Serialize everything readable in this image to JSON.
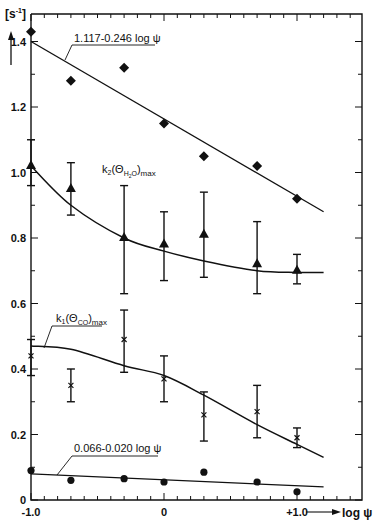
{
  "chart_data": {
    "type": "scatter",
    "title": "",
    "xlabel": "log ψ",
    "ylabel": "[s⁻¹]",
    "xlim": [
      -1.0,
      1.45
    ],
    "ylim": [
      0,
      1.48
    ],
    "x_ticks": [
      "-1.0",
      "0",
      "+1.0"
    ],
    "y_ticks": [
      "0",
      "0.2",
      "0.4",
      "0.6",
      "0.8",
      "1.0",
      "1.2",
      "1.4"
    ],
    "grid": false,
    "series": [
      {
        "name": "1.117 - 0.246 log ψ",
        "marker": "diamond",
        "x": [
          -1.0,
          -0.7,
          -0.3,
          0.0,
          0.3,
          0.7,
          1.0
        ],
        "y": [
          1.43,
          1.28,
          1.32,
          1.15,
          1.05,
          1.02,
          0.92
        ],
        "fit": {
          "type": "line",
          "x": [
            -1.0,
            1.2
          ],
          "y": [
            1.4,
            0.88
          ]
        }
      },
      {
        "name": "k2(ΘH2O)max",
        "marker": "triangle",
        "x": [
          -1.0,
          -0.7,
          -0.3,
          0.0,
          0.3,
          0.7,
          1.0
        ],
        "y": [
          1.02,
          0.95,
          0.8,
          0.78,
          0.81,
          0.72,
          0.7
        ],
        "err_low": [
          0.96,
          0.87,
          0.63,
          0.67,
          0.68,
          0.63,
          0.66
        ],
        "err_high": [
          1.1,
          1.03,
          0.96,
          0.88,
          0.94,
          0.85,
          0.75
        ],
        "fit": {
          "type": "curve",
          "x": [
            -1.0,
            -0.7,
            -0.3,
            0.0,
            0.3,
            0.7,
            1.0,
            1.2
          ],
          "y": [
            1.02,
            0.9,
            0.8,
            0.76,
            0.73,
            0.7,
            0.695,
            0.695
          ]
        }
      },
      {
        "name": "k1(ΘCO)max",
        "marker": "x",
        "x": [
          -1.0,
          -0.7,
          -0.3,
          0.0,
          0.3,
          0.7,
          1.0
        ],
        "y": [
          0.44,
          0.35,
          0.49,
          0.37,
          0.26,
          0.27,
          0.19
        ],
        "err_low": [
          0.38,
          0.3,
          0.39,
          0.3,
          0.18,
          0.19,
          0.16
        ],
        "err_high": [
          0.49,
          0.4,
          0.58,
          0.44,
          0.33,
          0.35,
          0.22
        ],
        "fit": {
          "type": "curve",
          "x": [
            -1.0,
            -0.7,
            -0.3,
            0.0,
            0.3,
            0.7,
            1.0,
            1.2
          ],
          "y": [
            0.47,
            0.46,
            0.41,
            0.38,
            0.32,
            0.23,
            0.17,
            0.13
          ]
        }
      },
      {
        "name": "0.066 - 0.020 log ψ",
        "marker": "circle",
        "x": [
          -1.0,
          -0.7,
          -0.3,
          0.0,
          0.3,
          0.7,
          1.0
        ],
        "y": [
          0.09,
          0.06,
          0.065,
          0.055,
          0.085,
          0.055,
          0.025
        ],
        "fit": {
          "type": "line",
          "x": [
            -1.0,
            1.2
          ],
          "y": [
            0.08,
            0.04
          ]
        }
      }
    ],
    "annotations": [
      "1.117-0.246 log ψ",
      "k2(ΘH2O)max",
      "k1(ΘCO)max",
      "0.066-0.020 log ψ"
    ]
  },
  "labels": {
    "y_unit": "[s",
    "y_unit_sup": "-1",
    "y_unit_close": "]",
    "x_axis_label": "log ψ",
    "ann_top": "1.117-0.246 log ψ",
    "ann_k2_main": "k",
    "ann_k2_sub1": "2",
    "ann_k2_paren": "(Θ",
    "ann_k2_sub2": "H",
    "ann_k2_sub3": "2",
    "ann_k2_sub4": "O",
    "ann_k2_close": ")",
    "ann_k2_max": "max",
    "ann_k1_main": "k",
    "ann_k1_sub1": "1",
    "ann_k1_paren": "(Θ",
    "ann_k1_sub2": "CO",
    "ann_k1_close": ")",
    "ann_k1_max": "max",
    "ann_bottom": "0.066-0.020 log ψ"
  }
}
